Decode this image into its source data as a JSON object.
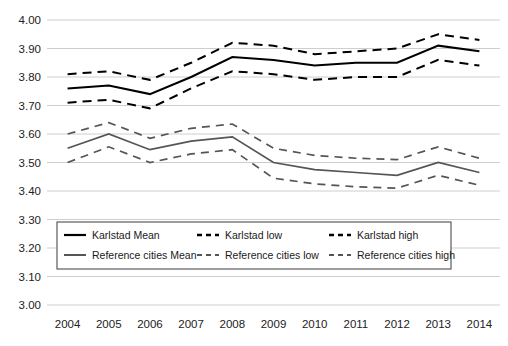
{
  "chart_data": {
    "type": "line",
    "title": "",
    "subtitle": "",
    "xlabel": "",
    "ylabel": "",
    "categories": [
      "2004",
      "2005",
      "2006",
      "2007",
      "2008",
      "2009",
      "2010",
      "2011",
      "2012",
      "2013",
      "2014"
    ],
    "x": [
      2004,
      2005,
      2006,
      2007,
      2008,
      2009,
      2010,
      2011,
      2012,
      2013,
      2014
    ],
    "ylim": [
      3.0,
      4.0
    ],
    "ytick_labels": [
      "4.00",
      "3.90",
      "3.80",
      "3.70",
      "3.60",
      "3.50",
      "3.40",
      "3.30",
      "3.20",
      "3.10",
      "3.00"
    ],
    "ytick_values": [
      4.0,
      3.9,
      3.8,
      3.7,
      3.6,
      3.5,
      3.4,
      3.3,
      3.2,
      3.1,
      3.0
    ],
    "ytick_step": 0.1,
    "grid": true,
    "grid_axis": "y",
    "legend_position": "inside-bottom-left",
    "legend_columns": 3,
    "series": [
      {
        "name": "Karlstad Mean",
        "style": "solid",
        "color": "#000000",
        "values": [
          3.76,
          3.77,
          3.74,
          3.8,
          3.87,
          3.86,
          3.84,
          3.85,
          3.85,
          3.91,
          3.89
        ]
      },
      {
        "name": "Karlstad low",
        "style": "dashed",
        "color": "#000000",
        "values": [
          3.71,
          3.72,
          3.69,
          3.76,
          3.82,
          3.81,
          3.79,
          3.8,
          3.8,
          3.86,
          3.84
        ]
      },
      {
        "name": "Karlstad high",
        "style": "dashed",
        "color": "#000000",
        "values": [
          3.81,
          3.82,
          3.79,
          3.85,
          3.92,
          3.91,
          3.88,
          3.89,
          3.9,
          3.95,
          3.93
        ]
      },
      {
        "name": "Reference cities Mean",
        "style": "solid",
        "color": "#555555",
        "values": [
          3.55,
          3.6,
          3.545,
          3.575,
          3.59,
          3.5,
          3.475,
          3.465,
          3.455,
          3.5,
          3.465
        ]
      },
      {
        "name": "Reference cities low",
        "style": "dashed",
        "color": "#555555",
        "values": [
          3.5,
          3.555,
          3.5,
          3.53,
          3.545,
          3.445,
          3.425,
          3.415,
          3.41,
          3.455,
          3.42
        ]
      },
      {
        "name": "Reference cities high",
        "style": "dashed",
        "color": "#555555",
        "values": [
          3.6,
          3.64,
          3.585,
          3.62,
          3.635,
          3.55,
          3.525,
          3.515,
          3.51,
          3.555,
          3.515
        ]
      }
    ]
  },
  "legend": {
    "entries": [
      {
        "label": "Karlstad Mean",
        "style": "solid",
        "color": "#000000"
      },
      {
        "label": "Karlstad low",
        "style": "dashed",
        "color": "#000000"
      },
      {
        "label": "Karlstad high",
        "style": "dashed",
        "color": "#000000"
      },
      {
        "label": "Reference cities Mean",
        "style": "solid",
        "color": "#555555"
      },
      {
        "label": "Reference cities low",
        "style": "dashed",
        "color": "#555555"
      },
      {
        "label": "Reference cities high",
        "style": "dashed",
        "color": "#555555"
      }
    ]
  },
  "colors": {
    "karlstad": "#000000",
    "reference_cities": "#555555",
    "gridline": "#c8c8c8",
    "background": "#ffffff",
    "legend_border": "#4d4d4d"
  }
}
